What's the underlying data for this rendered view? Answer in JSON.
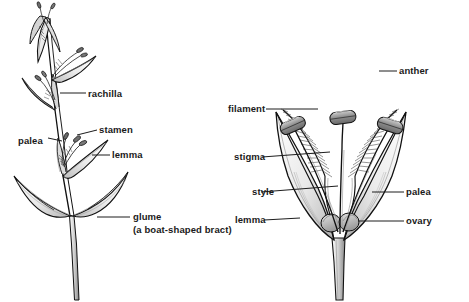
{
  "figure": {
    "background_color": "#ffffff",
    "ink_color": "#111111",
    "text_color": "#1a1a1a"
  },
  "panels": [
    {
      "name": "spikelet-branch",
      "description": "Grass inflorescence branch with spikelets, rachilla and basal glumes"
    },
    {
      "name": "dissected-floret",
      "description": "Opened grass floret showing three stamens, two plumose stigmas and ovary"
    }
  ],
  "left_labels": {
    "rachilla": "rachilla",
    "stamen": "stamen",
    "palea": "palea",
    "lemma": "lemma",
    "glume": "glume",
    "glume_note": "(a boat-shaped bract)"
  },
  "right_labels": {
    "filament": "filament",
    "stigma": "stigma",
    "style": "style",
    "lemma": "lemma",
    "anther": "anther",
    "palea": "palea",
    "ovary": "ovary"
  }
}
